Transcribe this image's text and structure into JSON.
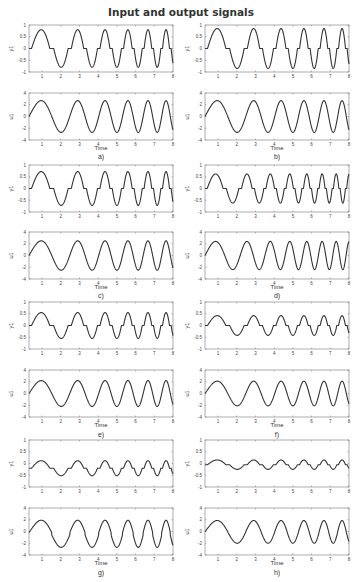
{
  "title": "Input and output signals",
  "layout": {
    "columns_x": [
      29,
      205
    ],
    "box_width": 144,
    "box_height": 47,
    "rows": [
      {
        "y1_top": 25,
        "u1_top": 93,
        "time_y": 150,
        "label_y": 157
      },
      {
        "y1_top": 165,
        "u1_top": 232,
        "time_y": 289,
        "label_y": 296
      },
      {
        "y1_top": 302,
        "u1_top": 370,
        "time_y": 427,
        "label_y": 435
      },
      {
        "y1_top": 440,
        "u1_top": 508,
        "time_y": 565,
        "label_y": 573
      }
    ]
  },
  "chart_data": [
    {
      "type": "line",
      "label": "a)",
      "col": 0,
      "row": 0,
      "xlabel": "Time",
      "xlim": [
        0.3,
        8
      ],
      "xticks": [
        1,
        2,
        3,
        4,
        5,
        6,
        7,
        8
      ],
      "top": {
        "ylabel": "y1",
        "ylim": [
          -1,
          1
        ],
        "yticks": [
          "1",
          "0.5",
          "0",
          "-0.5",
          "-1"
        ],
        "amplitude": 0.8,
        "deadzone": 0.3,
        "offset": 0
      },
      "bottom": {
        "ylabel": "u1",
        "ylim": [
          -4,
          4
        ],
        "yticks": [
          "4",
          "2",
          "0",
          "-2",
          "-4"
        ],
        "amplitude": 2.7
      },
      "chirp": {
        "f0": 0.35,
        "k": 0.05
      }
    },
    {
      "type": "line",
      "label": "b)",
      "col": 1,
      "row": 0,
      "xlabel": "Time",
      "xlim": [
        0.3,
        8
      ],
      "xticks": [
        1,
        2,
        3,
        4,
        5,
        6,
        7,
        8
      ],
      "top": {
        "ylabel": "y1",
        "ylim": [
          -1,
          1
        ],
        "yticks": [
          "1",
          "0.5",
          "0",
          "-0.5",
          "-1"
        ],
        "amplitude": 0.85,
        "deadzone": 0.3,
        "offset": 0
      },
      "bottom": {
        "ylabel": "u1",
        "ylim": [
          -4,
          4
        ],
        "yticks": [
          "4",
          "2",
          "0",
          "-2",
          "-4"
        ],
        "amplitude": 2.7
      },
      "chirp": {
        "f0": 0.35,
        "k": 0.05
      }
    },
    {
      "type": "line",
      "label": "c)",
      "col": 0,
      "row": 1,
      "xlabel": "Time",
      "xlim": [
        0.3,
        8
      ],
      "xticks": [
        1,
        2,
        3,
        4,
        5,
        6,
        7,
        8
      ],
      "top": {
        "ylabel": "y1",
        "ylim": [
          -1,
          1
        ],
        "yticks": [
          "1",
          "0.5",
          "0",
          "-0.5",
          "-1"
        ],
        "amplitude": 0.72,
        "deadzone": 0.3,
        "offset": 0
      },
      "bottom": {
        "ylabel": "u1",
        "ylim": [
          -4,
          4
        ],
        "yticks": [
          "4",
          "2",
          "0",
          "-2",
          "-4"
        ],
        "amplitude": 2.5
      },
      "chirp": {
        "f0": 0.35,
        "k": 0.05
      }
    },
    {
      "type": "line",
      "label": "d)",
      "col": 1,
      "row": 1,
      "xlabel": "Time",
      "xlim": [
        0.3,
        8
      ],
      "xticks": [
        1,
        2,
        3,
        4,
        5,
        6,
        7,
        8
      ],
      "top": {
        "ylabel": "y1",
        "ylim": [
          -1,
          1
        ],
        "yticks": [
          "1",
          "0.5",
          "0",
          "-0.5",
          "-1"
        ],
        "amplitude": 0.62,
        "deadzone": 0.3,
        "offset": 0
      },
      "bottom": {
        "ylabel": "u1",
        "ylim": [
          -4,
          4
        ],
        "yticks": [
          "4",
          "2",
          "0",
          "-2",
          "-4"
        ],
        "amplitude": 2.4
      },
      "chirp": {
        "f0": 0.4,
        "k": 0.07
      }
    },
    {
      "type": "line",
      "label": "e)",
      "col": 0,
      "row": 2,
      "xlabel": "Time",
      "xlim": [
        0.3,
        8
      ],
      "xticks": [
        1,
        2,
        3,
        4,
        5,
        6,
        7,
        8
      ],
      "top": {
        "ylabel": "y1",
        "ylim": [
          -1,
          1
        ],
        "yticks": [
          "1",
          "0.5",
          "0",
          "-0.5",
          "-1"
        ],
        "amplitude": 0.55,
        "deadzone": 0.3,
        "offset": 0
      },
      "bottom": {
        "ylabel": "u1",
        "ylim": [
          -4,
          4
        ],
        "yticks": [
          "4",
          "2",
          "0",
          "-2",
          "-4"
        ],
        "amplitude": 2.2
      },
      "chirp": {
        "f0": 0.35,
        "k": 0.05
      }
    },
    {
      "type": "line",
      "label": "f)",
      "col": 1,
      "row": 2,
      "xlabel": "Time",
      "xlim": [
        0.3,
        8
      ],
      "xticks": [
        1,
        2,
        3,
        4,
        5,
        6,
        7,
        8
      ],
      "top": {
        "ylabel": "y1",
        "ylim": [
          -1,
          1
        ],
        "yticks": [
          "1",
          "0.5",
          "0",
          "-0.5",
          "-1"
        ],
        "amplitude": 0.42,
        "deadzone": 0.3,
        "offset": 0
      },
      "bottom": {
        "ylabel": "u1",
        "ylim": [
          -4,
          4
        ],
        "yticks": [
          "4",
          "2",
          "0",
          "-2",
          "-4"
        ],
        "amplitude": 2.1
      },
      "chirp": {
        "f0": 0.35,
        "k": 0.05
      }
    },
    {
      "type": "line",
      "label": "g)",
      "col": 0,
      "row": 3,
      "xlabel": "Time",
      "xlim": [
        0.3,
        8
      ],
      "xticks": [
        1,
        2,
        3,
        4,
        5,
        6,
        7,
        8
      ],
      "top": {
        "ylabel": "y1",
        "ylim": [
          -1,
          1
        ],
        "yticks": [
          "1",
          "0.5",
          "0",
          "-0.5",
          "-1"
        ],
        "amplitude": 0.32,
        "deadzone": 0.3,
        "offset": -0.2
      },
      "bottom": {
        "ylabel": "u1",
        "ylim": [
          -4,
          4
        ],
        "yticks": [
          "4",
          "2",
          "0",
          "-2",
          "-4"
        ],
        "amplitude": 2.1,
        "u_offset": -0.6
      },
      "chirp": {
        "f0": 0.35,
        "k": 0.05
      }
    },
    {
      "type": "line",
      "label": "h)",
      "col": 1,
      "row": 3,
      "xlabel": "Time",
      "xlim": [
        0.3,
        8
      ],
      "xticks": [
        1,
        2,
        3,
        4,
        5,
        6,
        7,
        8
      ],
      "top": {
        "ylabel": "y1",
        "ylim": [
          -1,
          1
        ],
        "yticks": [
          "1",
          "0.5",
          "0",
          "-0.5",
          "-1"
        ],
        "amplitude": 0.2,
        "deadzone": 0.3,
        "offset": -0.05
      },
      "bottom": {
        "ylabel": "u1",
        "ylim": [
          -4,
          4
        ],
        "yticks": [
          "4",
          "2",
          "0",
          "-2",
          "-4"
        ],
        "amplitude": 1.9,
        "u_offset": -0.1
      },
      "chirp": {
        "f0": 0.35,
        "k": 0.05
      }
    }
  ]
}
